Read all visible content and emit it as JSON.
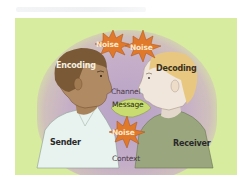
{
  "diagram": {
    "labels": {
      "encoding": "Encoding",
      "decoding": "Decoding",
      "channel": "Channel",
      "message": "Message",
      "sender": "Sender",
      "receiver": "Receiver",
      "context": "Context"
    },
    "noise": [
      {
        "label": "Noise",
        "position": "top-left"
      },
      {
        "label": "Noise",
        "position": "top-right"
      },
      {
        "label": "Noise",
        "position": "bottom-center"
      }
    ],
    "colors": {
      "background": "#d8eca0",
      "context_halo": "#b8a2c8",
      "noise_burst": "#e07a2a",
      "message_ellipse": "#c8dc70",
      "sender_hair": "#7a5a36",
      "sender_skin": "#b08a62",
      "sender_shirt": "#e8f2ee",
      "receiver_hair": "#e8c880",
      "receiver_skin": "#f0e6dc",
      "receiver_shirt": "#9aa67e"
    }
  }
}
